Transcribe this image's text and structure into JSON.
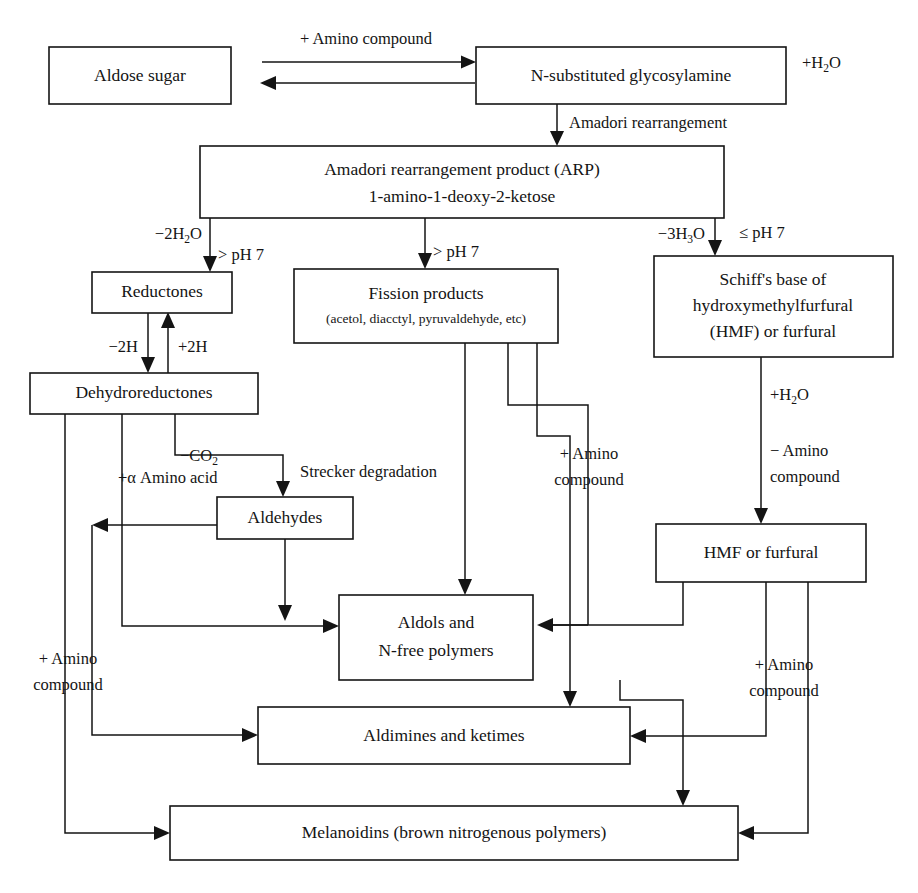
{
  "diagram": {
    "type": "flowchart",
    "stroke_color": "#141414",
    "background_color": "#ffffff"
  },
  "boxes": {
    "aldose_sugar": {
      "label": "Aldose sugar"
    },
    "glycosylamine": {
      "label": "N-substituted glycosylamine"
    },
    "arp": {
      "line1": "Amadori rearrangement product (ARP)",
      "line2": "1-amino-1-deoxy-2-ketose"
    },
    "reductones": {
      "label": "Reductones"
    },
    "fission_products": {
      "line1": "Fission products",
      "line2": "(acetol, diacctyl, pyruvaldehyde, etc)"
    },
    "schiffs_base": {
      "line1": "Schiff's base of",
      "line2": "hydroxymethylfurfural",
      "line3": "(HMF) or furfural"
    },
    "dehydroreductones": {
      "label": "Dehydroreductones"
    },
    "aldehydes": {
      "label": "Aldehydes"
    },
    "aldols": {
      "line1": "Aldols and",
      "line2": "N-free polymers"
    },
    "hmf_furfural": {
      "label": "HMF or furfural"
    },
    "aldimines": {
      "label": "Aldimines and ketimes"
    },
    "melanoidins": {
      "label": "Melanoidins (brown nitrogenous polymers)"
    }
  },
  "edge_labels": {
    "amino_compound_top": "+ Amino compound",
    "plus_h2o_top": {
      "pre": "+H",
      "sub": "2",
      "post": "O"
    },
    "amadori_rearrangement": "Amadori rearrangement",
    "minus_2h2o": {
      "pre": "−2H",
      "sub": "2",
      "post": "O"
    },
    "minus_3h2o": {
      "pre": "−3H",
      "sub": "3",
      "post": "O"
    },
    "gt_ph7_left": "> pH 7",
    "gt_ph7_mid": "> pH 7",
    "le_ph7_right": "≤ pH 7",
    "minus_2h": "−2H",
    "plus_2h": "+2H",
    "minus_co2": {
      "pre": "−CO",
      "sub": "2",
      "post": ""
    },
    "plus_alpha_amino_acid": "+α Amino acid",
    "strecker_degradation": "Strecker degradation",
    "plus_h2o_schiff": {
      "pre": "+H",
      "sub": "2",
      "post": "O"
    },
    "minus_amino_line1": "− Amino",
    "minus_amino_line2": "compound",
    "plus_amino_mid_line1": "+ Amino",
    "plus_amino_mid_line2": "compound",
    "plus_amino_left_line1": "+ Amino",
    "plus_amino_left_line2": "compound",
    "plus_amino_right_line1": "+ Amino",
    "plus_amino_right_line2": "compound"
  }
}
